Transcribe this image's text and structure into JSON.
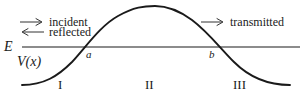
{
  "figure": {
    "width": 306,
    "height": 98,
    "background": "#ffffff",
    "caption_absent": true
  },
  "colors": {
    "curve": "#1a1a1a",
    "energy_line": "#8c8c8c",
    "text": "#1a1a1a",
    "arrow": "#333333",
    "background": "#ffffff"
  },
  "labels": {
    "energy_level": "E",
    "potential_function": "V(x)",
    "turning_point_left": "a",
    "turning_point_right": "b",
    "region_1": "I",
    "region_2": "II",
    "region_3": "III"
  },
  "annotations": [
    {
      "id": "incident",
      "text": "incident",
      "arrow_icon": "arrow-right-icon",
      "direction": "right"
    },
    {
      "id": "reflected",
      "text": "reflected",
      "arrow_icon": "arrow-left-icon",
      "direction": "left"
    },
    {
      "id": "transmitted",
      "text": "transmitted",
      "arrow_icon": "arrow-right-icon",
      "direction": "right"
    }
  ],
  "chart_data": {
    "type": "line",
    "title": "",
    "subtitle": "",
    "xlabel": "",
    "ylabel": "V(x)",
    "grid": false,
    "legend": null,
    "axes_shown": false,
    "series": [
      {
        "name": "V(x)",
        "description": "Smooth potential energy barrier, bell shaped",
        "color": "#1a1a1a",
        "path": "M 22 85 C 44 85 58 76 72 62 C 86 47 100 26 118 16 C 134 7 144 6 155 6 C 166 6 177 9 192 20 C 208 32 220 48 234 62 C 248 76 266 85 290 85"
      },
      {
        "name": "E",
        "description": "Horizontal constant total energy level line",
        "color": "#8c8c8c",
        "y": 47,
        "x_start": 22,
        "x_end": 300
      }
    ],
    "markers": [
      {
        "label": "a",
        "x": 89,
        "y": 47,
        "meaning": "left classical turning point where E = V(x)"
      },
      {
        "label": "b",
        "x": 212,
        "y": 47,
        "meaning": "right classical turning point where E = V(x)"
      }
    ],
    "regions": [
      {
        "label": "I",
        "x": 62,
        "range": "x < a"
      },
      {
        "label": "II",
        "x": 150,
        "range": "a < x < b"
      },
      {
        "label": "III",
        "x": 240,
        "range": "x > b"
      }
    ],
    "barrier_peak": {
      "x": 155,
      "y": 6
    }
  }
}
